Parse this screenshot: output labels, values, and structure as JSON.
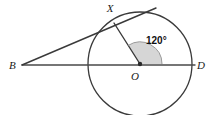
{
  "figure": {
    "type": "circle-geometry-diagram",
    "background_color": "#ffffff",
    "stroke_color": "#3a3a3a",
    "line_color": "#4a4a4a",
    "sector_fill_color": "#d2d2d2",
    "labels": {
      "point_b": "B",
      "point_x": "X",
      "point_o": "O",
      "point_d": "D",
      "angle_xod": "120°"
    },
    "geometry": {
      "circle": {
        "cx": 140,
        "cy": 64,
        "r": 52
      },
      "center_dot": {
        "cx": 140,
        "cy": 64,
        "r": 2.2
      },
      "point_b": {
        "x": 22,
        "y": 65
      },
      "point_x": {
        "x": 114,
        "y": 23
      },
      "point_d": {
        "x": 192,
        "y": 64
      },
      "secant_line": {
        "x1": 22,
        "y1": 65,
        "x2": 195,
        "y2": 65
      },
      "tangent_line": {
        "x1": 22,
        "y1": 65,
        "x2": 156,
        "y2": 8
      },
      "radius_ox": {
        "x1": 140,
        "y1": 64,
        "x2": 114,
        "y2": 23
      },
      "angle_arc_radius": 22,
      "angle_start_deg": 0,
      "angle_sweep_deg": 122
    },
    "label_positions": {
      "point_b": {
        "x": 9,
        "y": 69
      },
      "point_x": {
        "x": 110,
        "y": 12
      },
      "point_o": {
        "x": 135,
        "y": 80
      },
      "point_d": {
        "x": 197,
        "y": 69
      },
      "angle_xod": {
        "x": 146,
        "y": 44
      }
    }
  }
}
